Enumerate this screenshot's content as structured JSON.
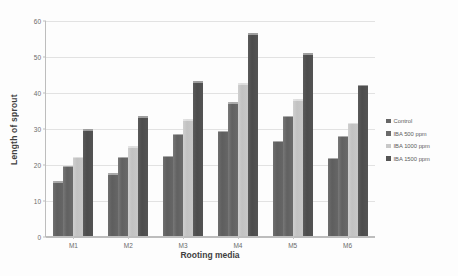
{
  "chart_data": {
    "type": "bar",
    "title": "",
    "xlabel": "Rooting media",
    "ylabel": "Length of sprout",
    "categories": [
      "M1",
      "M2",
      "M3",
      "M4",
      "M5",
      "M6"
    ],
    "ylim": [
      0,
      60
    ],
    "yticks": [
      0,
      10,
      20,
      30,
      40,
      50,
      60
    ],
    "grid": true,
    "legend_position": "right",
    "series": [
      {
        "name": "Control",
        "color": "#666666",
        "values": [
          15.2,
          17.4,
          22.3,
          29.2,
          26.4,
          21.8
        ]
      },
      {
        "name": "IBA 500 ppm",
        "color": "#6a6a6a",
        "values": [
          19.5,
          22.0,
          28.4,
          37.2,
          33.4,
          27.9
        ]
      },
      {
        "name": "IBA 1000 ppm",
        "color": "#c8c8c8",
        "values": [
          22.0,
          25.0,
          32.5,
          42.4,
          38.0,
          31.5
        ]
      },
      {
        "name": "IBA 1500 ppm",
        "color": "#545454",
        "values": [
          29.6,
          33.3,
          43.0,
          56.3,
          50.7,
          42.0
        ]
      }
    ]
  }
}
